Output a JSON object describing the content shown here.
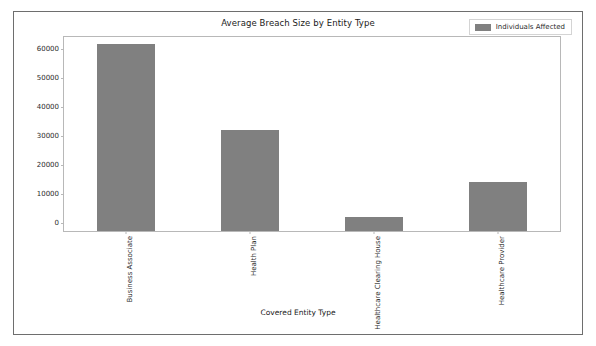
{
  "figure": {
    "background_color": "#ffffff",
    "frame_color": "#6e6e6e"
  },
  "chart_data": {
    "type": "bar",
    "title": "Average Breach Size by Entity Type",
    "xlabel": "Covered Entity Type",
    "ylabel": "",
    "categories": [
      "Business Associate",
      "Health Plan",
      "Healthcare Clearing House",
      "Healthcare Provider"
    ],
    "series": [
      {
        "name": "Individuals Affected",
        "color": "#808080",
        "values": [
          64500,
          35000,
          4800,
          17000
        ]
      }
    ],
    "values": [
      64500,
      35000,
      4800,
      17000
    ],
    "ylim": [
      0,
      67000
    ],
    "yticks": [
      0,
      10000,
      20000,
      30000,
      40000,
      50000,
      60000
    ],
    "ytick_labels": [
      "0",
      "10000",
      "20000",
      "30000",
      "40000",
      "50000",
      "60000"
    ],
    "grid": false,
    "legend": {
      "position": "upper right",
      "entries": [
        {
          "label": "Individuals Affected",
          "color": "#808080"
        }
      ]
    }
  }
}
